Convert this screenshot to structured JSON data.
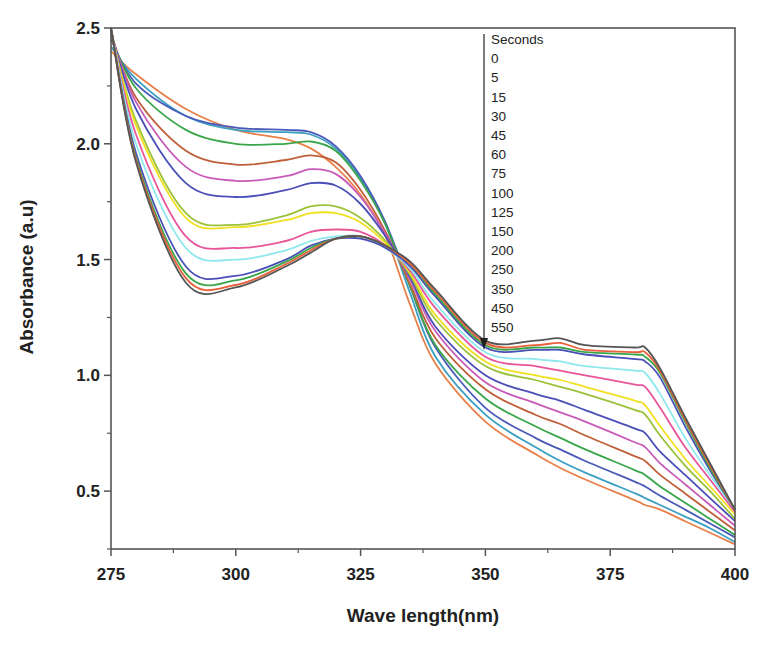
{
  "chart_data": {
    "type": "line",
    "title": "",
    "xlabel": "Wave length(nm)",
    "ylabel": "Absorbance (a.u)",
    "xlim": [
      275,
      400
    ],
    "ylim": [
      0.25,
      2.5
    ],
    "xticks": [
      275,
      300,
      325,
      350,
      375,
      400
    ],
    "xtick_labels": [
      "275",
      "300",
      "325",
      "350",
      "375",
      "400"
    ],
    "yticks": [
      0.5,
      1.0,
      1.5,
      2.0,
      2.5
    ],
    "ytick_labels": [
      "0.5",
      "1.0",
      "1.5",
      "2.0",
      "2.5"
    ],
    "grid": false,
    "legend": {
      "title": "Seconds",
      "position": "top-right-inside",
      "entries": [
        "0",
        "5",
        "15",
        "30",
        "45",
        "60",
        "75",
        "100",
        "125",
        "150",
        "200",
        "250",
        "350",
        "450",
        "550"
      ],
      "arrow": "downward arrow indicating increasing time"
    },
    "x": [
      275,
      280,
      290,
      300,
      310,
      315,
      320,
      325,
      330,
      335,
      340,
      350,
      360,
      365,
      370,
      380,
      382,
      385,
      390,
      395,
      400
    ],
    "series": [
      {
        "name": "0",
        "color": "#e8804a",
        "values": [
          2.4,
          2.3,
          2.15,
          2.06,
          2.02,
          1.98,
          1.9,
          1.78,
          1.6,
          1.3,
          1.05,
          0.8,
          0.66,
          0.6,
          0.55,
          0.46,
          0.44,
          0.42,
          0.37,
          0.32,
          0.27
        ]
      },
      {
        "name": "5",
        "color": "#3b9fc2",
        "values": [
          2.42,
          2.28,
          2.12,
          2.06,
          2.05,
          2.04,
          1.98,
          1.85,
          1.65,
          1.35,
          1.08,
          0.83,
          0.69,
          0.63,
          0.58,
          0.49,
          0.47,
          0.44,
          0.39,
          0.34,
          0.28
        ]
      },
      {
        "name": "15",
        "color": "#4a5ab8",
        "values": [
          2.45,
          2.26,
          2.12,
          2.07,
          2.06,
          2.05,
          1.99,
          1.86,
          1.66,
          1.38,
          1.12,
          0.86,
          0.73,
          0.68,
          0.63,
          0.54,
          0.52,
          0.48,
          0.42,
          0.36,
          0.3
        ]
      },
      {
        "name": "30",
        "color": "#3aa64a",
        "values": [
          2.46,
          2.24,
          2.06,
          2.0,
          2.0,
          2.01,
          1.97,
          1.84,
          1.65,
          1.38,
          1.13,
          0.9,
          0.78,
          0.73,
          0.68,
          0.59,
          0.57,
          0.52,
          0.45,
          0.38,
          0.31
        ]
      },
      {
        "name": "45",
        "color": "#c0603a",
        "values": [
          2.47,
          2.2,
          1.97,
          1.91,
          1.93,
          1.95,
          1.92,
          1.8,
          1.62,
          1.39,
          1.16,
          0.94,
          0.83,
          0.79,
          0.74,
          0.65,
          0.63,
          0.57,
          0.49,
          0.41,
          0.33
        ]
      },
      {
        "name": "60",
        "color": "#c85ab8",
        "values": [
          2.48,
          2.18,
          1.9,
          1.84,
          1.86,
          1.89,
          1.87,
          1.77,
          1.61,
          1.41,
          1.19,
          0.97,
          0.88,
          0.84,
          0.8,
          0.71,
          0.69,
          0.62,
          0.53,
          0.44,
          0.35
        ]
      },
      {
        "name": "75",
        "color": "#4a4fb8",
        "values": [
          2.48,
          2.15,
          1.83,
          1.77,
          1.8,
          1.83,
          1.82,
          1.74,
          1.6,
          1.42,
          1.21,
          1.0,
          0.92,
          0.89,
          0.85,
          0.77,
          0.75,
          0.67,
          0.57,
          0.47,
          0.37
        ]
      },
      {
        "name": "100",
        "color": "#9cc23a",
        "values": [
          2.48,
          2.1,
          1.7,
          1.65,
          1.69,
          1.73,
          1.73,
          1.68,
          1.58,
          1.43,
          1.24,
          1.04,
          0.98,
          0.95,
          0.92,
          0.85,
          0.83,
          0.74,
          0.61,
          0.5,
          0.38
        ]
      },
      {
        "name": "125",
        "color": "#f0e020",
        "values": [
          2.49,
          2.08,
          1.68,
          1.64,
          1.67,
          1.7,
          1.7,
          1.66,
          1.57,
          1.44,
          1.26,
          1.06,
          1.0,
          0.98,
          0.95,
          0.89,
          0.87,
          0.78,
          0.64,
          0.52,
          0.4
        ]
      },
      {
        "name": "150",
        "color": "#e8549a",
        "values": [
          2.49,
          2.04,
          1.6,
          1.55,
          1.58,
          1.62,
          1.63,
          1.62,
          1.56,
          1.45,
          1.29,
          1.08,
          1.04,
          1.02,
          1.0,
          0.96,
          0.95,
          0.86,
          0.69,
          0.55,
          0.41
        ]
      },
      {
        "name": "200",
        "color": "#8ee8ee",
        "values": [
          2.5,
          2.0,
          1.55,
          1.5,
          1.54,
          1.58,
          1.6,
          1.6,
          1.55,
          1.46,
          1.31,
          1.1,
          1.07,
          1.06,
          1.04,
          1.02,
          1.01,
          0.92,
          0.73,
          0.57,
          0.42
        ]
      },
      {
        "name": "250",
        "color": "#4a4fb8",
        "values": [
          2.5,
          1.96,
          1.47,
          1.43,
          1.5,
          1.56,
          1.59,
          1.59,
          1.55,
          1.47,
          1.34,
          1.12,
          1.11,
          1.11,
          1.09,
          1.07,
          1.06,
          0.99,
          0.78,
          0.59,
          0.42
        ]
      },
      {
        "name": "350",
        "color": "#3aa64a",
        "values": [
          2.5,
          1.94,
          1.44,
          1.41,
          1.49,
          1.55,
          1.59,
          1.6,
          1.56,
          1.48,
          1.35,
          1.13,
          1.12,
          1.12,
          1.1,
          1.09,
          1.08,
          1.01,
          0.8,
          0.6,
          0.42
        ]
      },
      {
        "name": "450",
        "color": "#e8603a",
        "values": [
          2.5,
          1.93,
          1.42,
          1.39,
          1.48,
          1.54,
          1.59,
          1.6,
          1.56,
          1.48,
          1.36,
          1.14,
          1.13,
          1.14,
          1.11,
          1.1,
          1.1,
          1.02,
          0.81,
          0.61,
          0.42
        ]
      },
      {
        "name": "550",
        "color": "#555555",
        "values": [
          2.5,
          1.92,
          1.4,
          1.38,
          1.47,
          1.53,
          1.59,
          1.6,
          1.56,
          1.49,
          1.37,
          1.15,
          1.15,
          1.16,
          1.13,
          1.12,
          1.12,
          1.03,
          0.82,
          0.62,
          0.42
        ]
      }
    ]
  }
}
